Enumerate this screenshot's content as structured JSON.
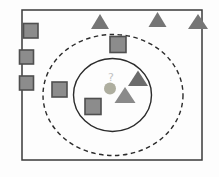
{
  "diagram": {
    "query_label": "?",
    "colors": {
      "background": "#fdfdfd",
      "box_border": "#3a3a3a",
      "square_fill": "#8c8c8c",
      "square_border": "#4f4f4f",
      "triangle_normal": "#757575",
      "triangle_dark": "#6b6b6b",
      "triangle_light": "#8a8a8a",
      "query_fill": "#aeae9f",
      "query_label_color": "#c2c2c2",
      "circle_stroke": "#2b2b2b"
    },
    "box": {
      "x": 22,
      "y": 10,
      "width": 180,
      "height": 150
    },
    "circles": [
      {
        "name": "outer-dashed-circle",
        "cx": 113,
        "cy": 95,
        "rx": 70,
        "ry": 60.5,
        "dashed": true
      },
      {
        "name": "inner-solid-circle",
        "cx": 112.5,
        "cy": 95,
        "rx": 39,
        "ry": 36.5,
        "dashed": false
      }
    ],
    "query_point": {
      "cx": 110,
      "cy": 88.5,
      "r": 6,
      "label_x": 111,
      "label_y": 81,
      "label_size": 11
    },
    "squares": [
      {
        "x": 23.5,
        "y": 23.5,
        "size": 14.5
      },
      {
        "x": 19.5,
        "y": 50.0,
        "size": 14
      },
      {
        "x": 19.5,
        "y": 76.0,
        "size": 14
      },
      {
        "x": 110.0,
        "y": 36.5,
        "size": 16
      },
      {
        "x": 52.0,
        "y": 82.0,
        "size": 15
      },
      {
        "x": 85.0,
        "y": 98.5,
        "size": 16
      }
    ],
    "triangles": [
      {
        "cx": 100.0,
        "apex_y": 14,
        "base_y": 29,
        "hw": 9,
        "shade": "normal"
      },
      {
        "cx": 157.5,
        "apex_y": 12,
        "base_y": 27,
        "hw": 9,
        "shade": "normal"
      },
      {
        "cx": 198.0,
        "apex_y": 14,
        "base_y": 29,
        "hw": 10,
        "shade": "normal"
      },
      {
        "cx": 138.0,
        "apex_y": 70.5,
        "base_y": 86,
        "hw": 10,
        "shade": "dark"
      },
      {
        "cx": 125.0,
        "apex_y": 87.0,
        "base_y": 103,
        "hw": 10.5,
        "shade": "light"
      }
    ]
  }
}
